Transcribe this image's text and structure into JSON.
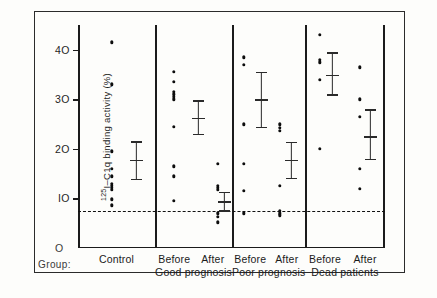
{
  "chart_data": {
    "type": "scatter",
    "title": "",
    "xlabel": "Group:",
    "ylabel": "125I-C1q binding activity (%)",
    "ylim": [
      0,
      45
    ],
    "yticks": [
      10,
      20,
      30,
      40
    ],
    "ytick_labels": [
      "IO",
      "2O",
      "3O",
      "4O"
    ],
    "zero_tick_label": "O",
    "grid": false,
    "legend": false,
    "reference_line": {
      "label": "upper normal limit",
      "value": 7.5,
      "style": "dashed"
    },
    "groups": [
      {
        "name": "Control",
        "panel": 1,
        "columns": [
          {
            "label": "Control",
            "values": [
              41.5,
              33.0,
              19.5,
              16.0,
              14.5,
              13.0,
              12.6,
              12.2,
              11.8,
              9.8,
              8.6
            ],
            "mean": 17.8,
            "error_low": 14.0,
            "error_high": 21.5
          }
        ]
      },
      {
        "name": "Good prognosis",
        "panel": 2,
        "columns": [
          {
            "label": "Before",
            "values": [
              35.5,
              33.5,
              31.5,
              31.0,
              30.5,
              30.0,
              24.5,
              16.5,
              14.5,
              9.5
            ],
            "mean": 26.3,
            "error_low": 23.0,
            "error_high": 29.8
          },
          {
            "label": "After",
            "values": [
              17.0,
              12.5,
              12.2,
              11.8,
              7.0,
              6.3,
              5.2
            ],
            "mean": 9.4,
            "error_low": 7.6,
            "error_high": 11.3
          }
        ]
      },
      {
        "name": "Poor prognosis",
        "panel": 3,
        "columns": [
          {
            "label": "Before",
            "values": [
              38.5,
              37.0,
              25.0,
              17.0,
              11.5,
              7.0
            ],
            "mean": 30.0,
            "error_low": 24.5,
            "error_high": 35.5
          },
          {
            "label": "After",
            "values": [
              25.0,
              24.2,
              23.6,
              12.5,
              7.5,
              7.0,
              6.6
            ],
            "mean": 17.8,
            "error_low": 14.2,
            "error_high": 21.4
          }
        ]
      },
      {
        "name": "Dead patients",
        "panel": 4,
        "columns": [
          {
            "label": "Before",
            "values": [
              43.0,
              38.0,
              37.5,
              34.0,
              20.0
            ],
            "mean": 35.0,
            "error_low": 31.0,
            "error_high": 39.5
          },
          {
            "label": "After",
            "values": [
              36.5,
              30.0,
              26.5,
              16.0,
              12.0
            ],
            "mean": 22.5,
            "error_low": 18.0,
            "error_high": 28.0
          }
        ]
      }
    ]
  },
  "axis": {
    "y_title_prefix": "125",
    "y_title_main": "I–C1q binding activity (%)",
    "tick_40": "4O",
    "tick_30": "3O",
    "tick_20": "2O",
    "tick_10": "IO",
    "tick_0": "O"
  },
  "footer": {
    "group_label": "Group:",
    "categories": [
      {
        "name": "Control",
        "subs": []
      },
      {
        "name": "Good prognosis",
        "subs": [
          "Before",
          "After"
        ]
      },
      {
        "name": "Poor prognosis",
        "subs": [
          "Before",
          "After"
        ]
      },
      {
        "name": "Dead patients",
        "subs": [
          "Before",
          "After"
        ]
      }
    ]
  },
  "colors": {
    "ink": "#1b1b1b",
    "paper": "#fdfdfb",
    "dot": "#0d0d0d"
  }
}
